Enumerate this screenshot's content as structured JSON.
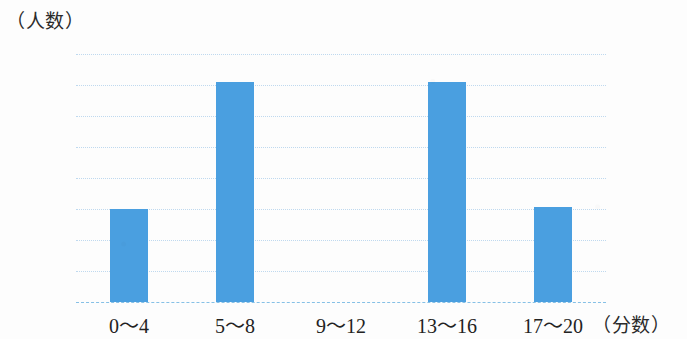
{
  "chart_data": {
    "type": "bar",
    "title": "",
    "subtitle": "",
    "xlabel": "（分数）",
    "ylabel": "（人数）",
    "categories": [
      "0～4",
      "5～8",
      "9～12",
      "13～16",
      "17～20"
    ],
    "values": [
      6,
      14.2,
      0,
      14.2,
      6.1
    ],
    "series": [
      {
        "name": "人数",
        "values": [
          6,
          14.2,
          0,
          14.2,
          6.1
        ]
      }
    ],
    "ylim": [
      0,
      16
    ],
    "yticks": [
      0,
      2,
      4,
      6,
      8,
      10,
      12,
      14,
      16
    ],
    "ytick_labels": [
      "0",
      "2",
      "4",
      "6",
      "8",
      "10",
      "12",
      "14",
      "16"
    ],
    "grid": true,
    "grid_axis": "y",
    "legend": false,
    "legend_position": "none",
    "bar_color": "#4a9fe0",
    "grid_color": "#bcd8ef",
    "baseline_color": "#86c0e6",
    "background_color": "#fdfdfd",
    "text_color": "#232323"
  }
}
